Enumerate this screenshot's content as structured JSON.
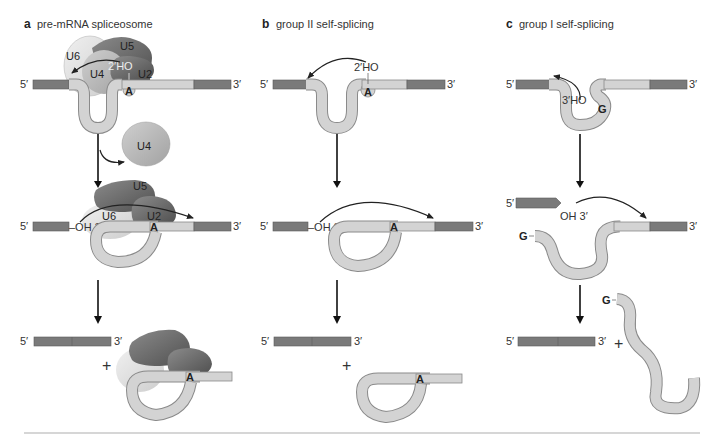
{
  "panels": {
    "a": {
      "letter": "a",
      "title": "pre-mRNA spliceosome"
    },
    "b": {
      "letter": "b",
      "title": "group II self-splicing"
    },
    "c": {
      "letter": "c",
      "title": "group I self-splicing"
    }
  },
  "labels": {
    "five_prime": "5′",
    "three_prime": "3′",
    "plus": "+",
    "branch_a": "A",
    "guanosine": "G",
    "two_prime_ho": "2′HO",
    "two_prime_ho_spliceosome": "2′HO",
    "three_prime_ho": "3′HO",
    "oh_three_prime": "OH 3′",
    "dash_oh_three_prime": "–OH 3′"
  },
  "snrnps": {
    "u2": "U2",
    "u4": "U4",
    "u5": "U5",
    "u6": "U6"
  },
  "colors": {
    "exon": "#7a7a7a",
    "intron": "#d3d3d3",
    "u5": "#6e6e6e",
    "u2": "#5f5f5f",
    "u4": "#b8b8b8",
    "u6": "#e0e0e0",
    "divider": "#c8c8c8"
  }
}
